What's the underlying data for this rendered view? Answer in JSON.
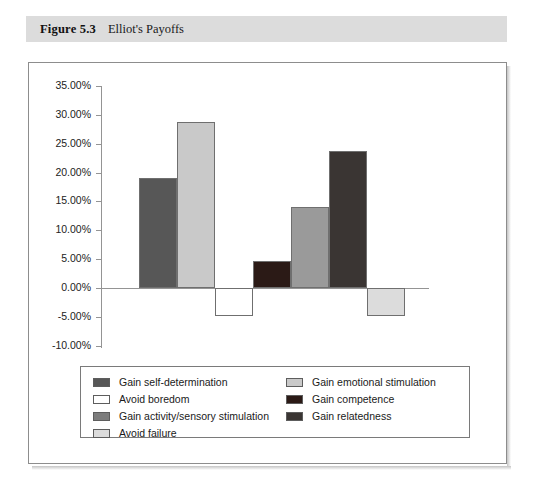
{
  "figure": {
    "number": "Figure 5.3",
    "title": "Elliot's Payoffs"
  },
  "chart_data": {
    "type": "bar",
    "title": "Elliot's Payoffs",
    "xlabel": "",
    "ylabel": "",
    "ylim": [
      -10,
      35
    ],
    "grid": false,
    "legend_position": "bottom",
    "ytick_labels": [
      "35.00%",
      "30.00%",
      "25.00%",
      "20.00%",
      "15.00%",
      "10.00%",
      "5.00%",
      "0.00%",
      "-5.00%",
      "-10.00%"
    ],
    "ytick_values": [
      35,
      30,
      25,
      20,
      15,
      10,
      5,
      0,
      -5,
      -10
    ],
    "categories": [
      "Gain self-determination",
      "Gain emotional stimulation",
      "Avoid boredom",
      "Gain competence",
      "Gain activity/sensory stimulation",
      "Gain relatedness",
      "Avoid failure"
    ],
    "values": [
      19.0,
      28.7,
      -4.9,
      4.7,
      14.0,
      23.7,
      -4.8
    ],
    "colors": [
      "#575757",
      "#c9c9c9",
      "#ffffff",
      "#2b1a16",
      "#9a9a9a",
      "#3a3533",
      "#dcdcdc"
    ]
  },
  "legend": {
    "entries": [
      {
        "label": "Gain self-determination",
        "color": "#575757"
      },
      {
        "label": "Avoid boredom",
        "color": "#ffffff"
      },
      {
        "label": "Gain activity/sensory stimulation",
        "color": "#7d7d7d"
      },
      {
        "label": "Avoid failure",
        "color": "#dcdcdc"
      },
      {
        "label": "Gain emotional stimulation",
        "color": "#c9c9c9"
      },
      {
        "label": "Gain competence",
        "color": "#2b1a16"
      },
      {
        "label": "Gain relatedness",
        "color": "#3a3533"
      }
    ]
  }
}
